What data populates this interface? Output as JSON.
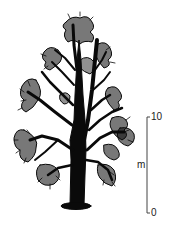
{
  "figure": {
    "ink_color": "#0a0a0a",
    "background": "#ffffff"
  },
  "scale_bar": {
    "top_label": "10",
    "bottom_label": "0",
    "unit_label": "m",
    "line_color": "#444444"
  }
}
